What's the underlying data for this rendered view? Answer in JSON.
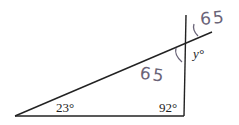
{
  "diagram": {
    "type": "geometry-triangle",
    "angles": {
      "bottom_left": "23°",
      "bottom_right": "92°",
      "unknown": "y°"
    },
    "annotations": {
      "handwritten_inner": "65",
      "handwritten_outer": "65"
    },
    "colors": {
      "line": "#222222",
      "handwriting": "#6a6478"
    }
  }
}
